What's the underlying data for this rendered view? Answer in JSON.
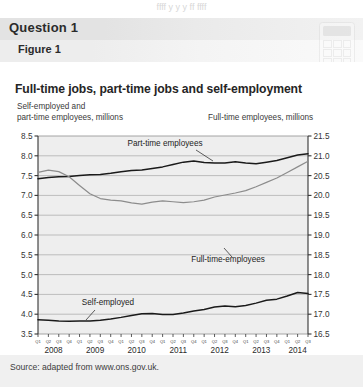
{
  "bleed_top_text": "ffff  y  y y ff ffff",
  "question": {
    "label": "Question 1"
  },
  "figure": {
    "label": "Figure 1"
  },
  "icons": {
    "watermark": "calculator-icon"
  },
  "source": {
    "text": "Source: adapted from www.ons.gov.uk."
  },
  "colors": {
    "banner": "#e3e3e3",
    "figure_band": "#ededed",
    "plot_bg": "#eeeeee",
    "grid": "#9a9a9a",
    "axis": "#333333",
    "series_dark": "#1a1a1a",
    "series_gray": "#8c8c8c",
    "source_bg": "#f0f0f0"
  },
  "chart_data": {
    "type": "line",
    "title": "Full-time jobs, part-time jobs and self-employment",
    "ylabel": "Self-employed and\npart-time employees, millions",
    "ylabel_right": "Full-time employees, millions",
    "xlabel": "",
    "grid": true,
    "legend": "inline-annotations",
    "ylim": [
      3.5,
      8.5
    ],
    "ylim_right": [
      16.5,
      21.5
    ],
    "yticks": [
      "8.5",
      "8.0",
      "7.5",
      "7.0",
      "6.5",
      "6.0",
      "5.5",
      "5.0",
      "4.5",
      "4.0",
      "3.5"
    ],
    "yticks_right": [
      "21.5",
      "21.0",
      "20.5",
      "20.0",
      "19.5",
      "19.0",
      "18.5",
      "18.0",
      "17.5",
      "17.0",
      "16.5"
    ],
    "years": [
      "2008",
      "2009",
      "2010",
      "2011",
      "2012",
      "2013",
      "2014"
    ],
    "quarter_labels": [
      "Q1",
      "Q2",
      "Q3",
      "Q4",
      "Q1",
      "Q2",
      "Q3",
      "Q4",
      "Q1",
      "Q2",
      "Q3",
      "Q4",
      "Q1",
      "Q2",
      "Q3",
      "Q4",
      "Q1",
      "Q2",
      "Q3",
      "Q4",
      "Q1",
      "Q2",
      "Q3",
      "Q4",
      "Q1",
      "Q2",
      "Q3"
    ],
    "x": [
      "2008 Q1",
      "2008 Q2",
      "2008 Q3",
      "2008 Q4",
      "2009 Q1",
      "2009 Q2",
      "2009 Q3",
      "2009 Q4",
      "2010 Q1",
      "2010 Q2",
      "2010 Q3",
      "2010 Q4",
      "2011 Q1",
      "2011 Q2",
      "2011 Q3",
      "2011 Q4",
      "2012 Q1",
      "2012 Q2",
      "2012 Q3",
      "2012 Q4",
      "2013 Q1",
      "2013 Q2",
      "2013 Q3",
      "2013 Q4",
      "2014 Q1",
      "2014 Q2",
      "2014 Q3"
    ],
    "series": [
      {
        "name": "Part-time employees",
        "axis": "left",
        "color": "#1a1a1a",
        "annotation": "Part-time employees",
        "values": [
          7.42,
          7.45,
          7.47,
          7.48,
          7.5,
          7.52,
          7.53,
          7.56,
          7.6,
          7.63,
          7.64,
          7.68,
          7.72,
          7.78,
          7.84,
          7.87,
          7.83,
          7.82,
          7.82,
          7.85,
          7.82,
          7.8,
          7.84,
          7.88,
          7.95,
          8.02,
          8.05
        ]
      },
      {
        "name": "Full-time employees",
        "axis": "right",
        "color": "#8c8c8c",
        "annotation": "Full-time-employees",
        "values": [
          20.58,
          20.64,
          20.6,
          20.47,
          20.25,
          20.04,
          19.92,
          19.88,
          19.86,
          19.81,
          19.78,
          19.83,
          19.86,
          19.84,
          19.82,
          19.84,
          19.88,
          19.96,
          20.01,
          20.06,
          20.12,
          20.22,
          20.33,
          20.44,
          20.58,
          20.72,
          20.86
        ]
      },
      {
        "name": "Self-employed",
        "axis": "left",
        "color": "#1a1a1a",
        "annotation": "Self-employed",
        "values": [
          3.86,
          3.85,
          3.83,
          3.82,
          3.83,
          3.83,
          3.85,
          3.88,
          3.92,
          3.97,
          4.01,
          4.02,
          3.99,
          3.99,
          4.03,
          4.08,
          4.12,
          4.18,
          4.21,
          4.19,
          4.22,
          4.28,
          4.35,
          4.38,
          4.46,
          4.55,
          4.52
        ]
      }
    ]
  }
}
